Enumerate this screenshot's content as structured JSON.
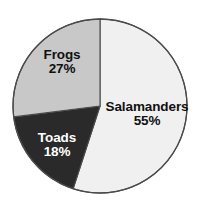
{
  "chart_data": {
    "type": "pie",
    "title": "",
    "subtitle": "",
    "xlabel": "",
    "ylabel": "",
    "legend": "none",
    "grid": false,
    "labels_inside_slices": true,
    "start_angle_deg": 0,
    "direction": "clockwise",
    "categories": [
      "Salamanders",
      "Toads",
      "Frogs"
    ],
    "values": [
      55,
      18,
      27
    ],
    "value_unit": "%",
    "slices": [
      {
        "label": "Salamanders",
        "value": 55,
        "value_text": "55%",
        "color": "#f0f0f0",
        "text_color": "#111111",
        "start_deg": 0,
        "end_deg": 198
      },
      {
        "label": "Toads",
        "value": 18,
        "value_text": "18%",
        "color": "#2a2a2a",
        "text_color": "#ffffff",
        "start_deg": 198,
        "end_deg": 262.8
      },
      {
        "label": "Frogs",
        "value": 27,
        "value_text": "27%",
        "color": "#c8c8c8",
        "text_color": "#111111",
        "start_deg": 262.8,
        "end_deg": 360
      }
    ],
    "colors": {
      "salamanders": "#f0f0f0",
      "toads": "#2a2a2a",
      "frogs": "#c8c8c8",
      "outline": "#4a4a4a",
      "background": "#ffffff"
    },
    "geometry": {
      "center_x": 100,
      "center_y": 106,
      "radius": 87
    }
  }
}
